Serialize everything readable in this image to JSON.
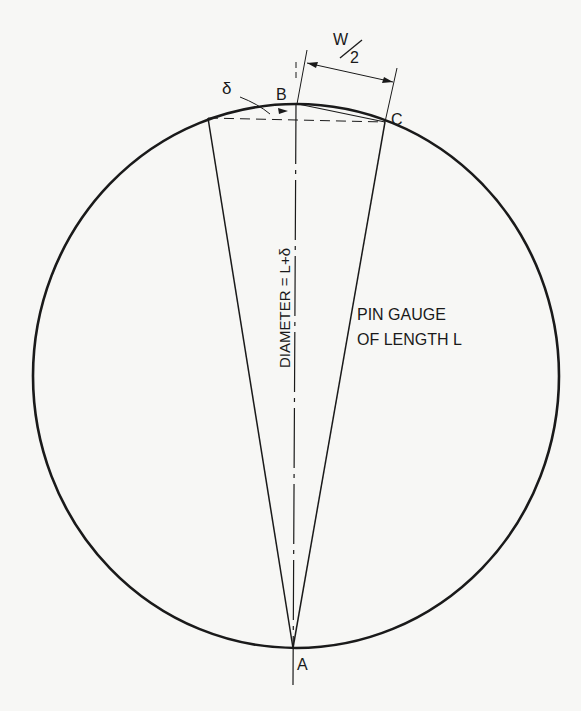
{
  "figure": {
    "labels": {
      "point_a": "A",
      "point_b": "B",
      "point_c": "C",
      "delta": "δ",
      "half_width_numerator": "W",
      "half_width_denominator": "2",
      "diameter": "DIAMETER = L+δ",
      "pin_gauge_line1": "PIN GAUGE",
      "pin_gauge_line2": "OF LENGTH L"
    },
    "colors": {
      "ink": "#1a1a1a",
      "paper": "#f7f7f5"
    }
  }
}
